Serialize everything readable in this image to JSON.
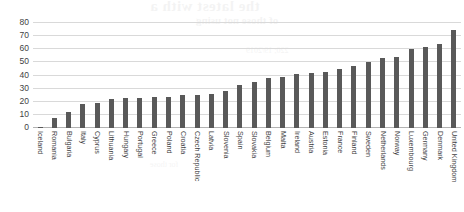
{
  "chart_data": {
    "type": "bar",
    "title": "",
    "xlabel": "",
    "ylabel": "",
    "ylim": [
      0,
      80
    ],
    "yticks": [
      0,
      10,
      20,
      30,
      40,
      50,
      60,
      70,
      80
    ],
    "grid": true,
    "legend": null,
    "bar_color": "#595959",
    "categories": [
      "Iceland",
      "Romania",
      "Bulgaria",
      "Italy",
      "Cyprus",
      "Lithuania",
      "Hungary",
      "Portugal",
      "Greece",
      "Poland",
      "Croatia",
      "Czech Republic",
      "Latvia",
      "Slovenia",
      "Spain",
      "Slovakia",
      "Belgium",
      "Malta",
      "Ireland",
      "Austria",
      "Estonia",
      "France",
      "Finland",
      "Sweden",
      "Netherlands",
      "Norway",
      "Luxembourg",
      "Germany",
      "Denmark",
      "United Kingdom"
    ],
    "values": [
      1,
      8,
      12,
      18,
      19,
      22,
      23,
      23,
      24,
      24,
      25,
      25,
      26,
      28,
      33,
      35,
      38,
      39,
      41,
      42,
      43,
      45,
      47,
      50,
      53,
      54,
      60,
      62,
      64,
      75
    ]
  },
  "bleed_through": {
    "line1": "the latest with a",
    "line2": "of those not using",
    "line3": "220; 19/2019",
    "line4": "for those"
  }
}
